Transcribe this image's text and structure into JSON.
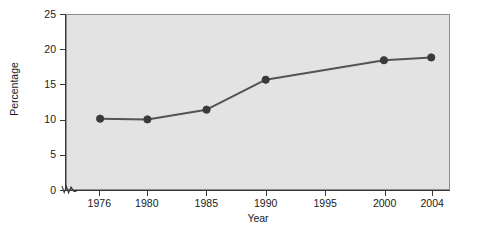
{
  "chart_data": {
    "type": "line",
    "title": "",
    "subtitle": "",
    "xlabel": "Year",
    "ylabel": "Percentage",
    "x": [
      1976,
      1980,
      1985,
      1990,
      2000,
      2004
    ],
    "values": [
      10.1,
      10.0,
      11.4,
      15.7,
      18.5,
      18.9
    ],
    "series": [
      {
        "name": "Percentage",
        "x": [
          1976,
          1980,
          1985,
          1990,
          2000,
          2004
        ],
        "values": [
          10.1,
          10.0,
          11.4,
          15.7,
          18.5,
          18.9
        ]
      }
    ],
    "xticks": [
      1976,
      1980,
      1985,
      1990,
      1995,
      2000,
      2004
    ],
    "xticklabels": [
      "1976",
      "1980",
      "1985",
      "1990",
      "1995",
      "2000",
      "2004"
    ],
    "yticks": [
      0,
      5,
      10,
      15,
      20,
      25
    ],
    "yticklabels": [
      "0",
      "5",
      "10",
      "15",
      "20",
      "25"
    ],
    "xlim": [
      1973.2,
      2005.5
    ],
    "ylim": [
      0,
      25
    ],
    "grid": false,
    "legend": false,
    "legend_position": "none",
    "annotations": [
      "axis-break on y-axis near origin"
    ],
    "colors": {
      "plot_background": "#e3e3e3",
      "figure_background": "#ffffff",
      "line": "#545454",
      "marker": "#3a3a3a",
      "axis": "#3a3a3a",
      "text": "#1a1a1a",
      "frame": "#8c8c8c"
    },
    "line_width": 2.0,
    "marker": "circle",
    "marker_size": 4
  }
}
